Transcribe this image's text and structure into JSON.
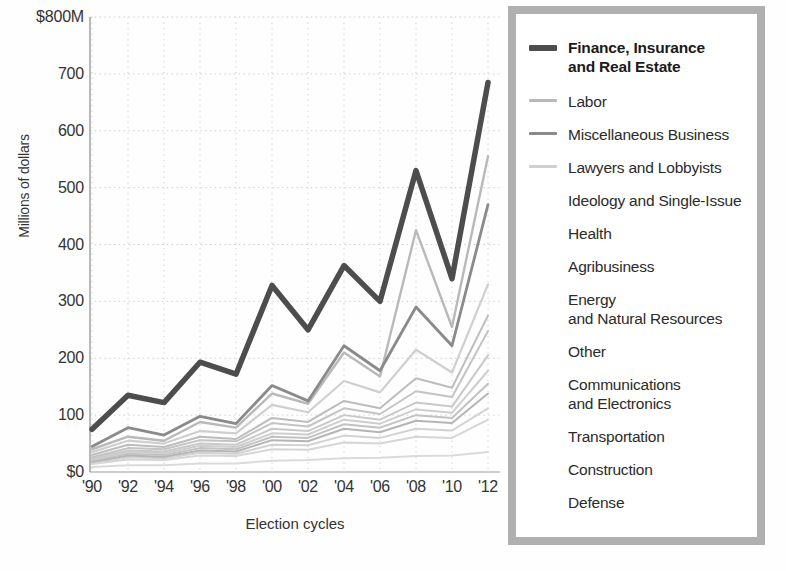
{
  "axes": {
    "y_label": "Millions of dollars",
    "y_ticks": [
      "$800M",
      "700",
      "600",
      "500",
      "400",
      "300",
      "200",
      "100",
      "$0"
    ],
    "x_label": "Election cycles",
    "x_ticks": [
      "'90",
      "'92",
      "'94",
      "'96",
      "'98",
      "'00",
      "'02",
      "'04",
      "'06",
      "'08",
      "'10",
      "'12"
    ]
  },
  "legend": {
    "items": [
      {
        "label": "Finance, Insurance\nand Real Estate",
        "color": "#4d4d4d",
        "width": 5.5,
        "swatch": true,
        "primary": true
      },
      {
        "label": "Labor",
        "color": "#b9b9b9",
        "width": 2.4,
        "swatch": true,
        "primary": false
      },
      {
        "label": "Miscellaneous Business",
        "color": "#8a8a8a",
        "width": 2.8,
        "swatch": true,
        "primary": false
      },
      {
        "label": "Lawyers and Lobbyists",
        "color": "#cfcfcf",
        "width": 2.2,
        "swatch": true,
        "primary": false
      },
      {
        "label": "Ideology and Single-Issue",
        "color": "#bdbdbd",
        "width": 2.0,
        "swatch": false,
        "primary": false
      },
      {
        "label": "Health",
        "color": "#c4c4c4",
        "width": 2.0,
        "swatch": false,
        "primary": false
      },
      {
        "label": "Agribusiness",
        "color": "#c9c9c9",
        "width": 2.0,
        "swatch": false,
        "primary": false
      },
      {
        "label": "Energy\nand Natural Resources",
        "color": "#cecece",
        "width": 2.0,
        "swatch": false,
        "primary": false
      },
      {
        "label": "Other",
        "color": "#c2c2c2",
        "width": 2.0,
        "swatch": false,
        "primary": false
      },
      {
        "label": "Communications\nand Electronics",
        "color": "#b5b5b5",
        "width": 2.0,
        "swatch": false,
        "primary": false
      },
      {
        "label": "Transportation",
        "color": "#d2d2d2",
        "width": 2.0,
        "swatch": false,
        "primary": false
      },
      {
        "label": "Construction",
        "color": "#d6d6d6",
        "width": 2.0,
        "swatch": false,
        "primary": false
      },
      {
        "label": "Defense",
        "color": "#dadada",
        "width": 2.0,
        "swatch": false,
        "primary": false
      }
    ]
  },
  "chart_data": {
    "type": "line",
    "title": "",
    "xlabel": "Election cycles",
    "ylabel": "Millions of dollars",
    "categories": [
      "'90",
      "'92",
      "'94",
      "'96",
      "'98",
      "'00",
      "'02",
      "'04",
      "'06",
      "'08",
      "'10",
      "'12"
    ],
    "ylim": [
      0,
      800
    ],
    "yticks": [
      0,
      100,
      200,
      300,
      400,
      500,
      600,
      700,
      800
    ],
    "grid": "dotted",
    "legend_position": "right",
    "units": "millions of US dollars",
    "series": [
      {
        "name": "Finance, Insurance and Real Estate",
        "color": "#4d4d4d",
        "width": 5.5,
        "values": [
          75,
          135,
          122,
          193,
          172,
          328,
          250,
          363,
          300,
          530,
          340,
          685
        ]
      },
      {
        "name": "Labor",
        "color": "#b9b9b9",
        "width": 2.4,
        "values": [
          40,
          62,
          55,
          88,
          78,
          138,
          120,
          210,
          168,
          425,
          255,
          555
        ]
      },
      {
        "name": "Miscellaneous Business",
        "color": "#8a8a8a",
        "width": 2.8,
        "values": [
          45,
          78,
          65,
          98,
          85,
          152,
          125,
          222,
          178,
          290,
          222,
          470
        ]
      },
      {
        "name": "Lawyers and Lobbyists",
        "color": "#cfcfcf",
        "width": 2.2,
        "values": [
          35,
          55,
          50,
          72,
          68,
          118,
          105,
          160,
          140,
          215,
          175,
          330
        ]
      },
      {
        "name": "Ideology and Single-Issue",
        "color": "#bdbdbd",
        "width": 2.0,
        "values": [
          30,
          48,
          44,
          62,
          58,
          95,
          88,
          125,
          112,
          165,
          148,
          275
        ]
      },
      {
        "name": "Health",
        "color": "#c4c4c4",
        "width": 2.0,
        "values": [
          26,
          42,
          40,
          56,
          54,
          86,
          80,
          112,
          102,
          142,
          132,
          248
        ]
      },
      {
        "name": "Agribusiness",
        "color": "#c9c9c9",
        "width": 2.0,
        "values": [
          24,
          38,
          36,
          50,
          48,
          76,
          72,
          100,
          92,
          122,
          115,
          205
        ]
      },
      {
        "name": "Energy and Natural Resources",
        "color": "#cecece",
        "width": 2.0,
        "values": [
          22,
          35,
          33,
          46,
          44,
          68,
          66,
          92,
          85,
          110,
          104,
          178
        ]
      },
      {
        "name": "Other",
        "color": "#c2c2c2",
        "width": 2.0,
        "values": [
          20,
          32,
          30,
          42,
          40,
          62,
          60,
          84,
          78,
          100,
          95,
          155
        ]
      },
      {
        "name": "Communications and Electronics",
        "color": "#b5b5b5",
        "width": 2.0,
        "values": [
          18,
          29,
          27,
          38,
          36,
          56,
          54,
          76,
          70,
          90,
          86,
          138
        ]
      },
      {
        "name": "Transportation",
        "color": "#d2d2d2",
        "width": 2.0,
        "values": [
          16,
          26,
          24,
          34,
          32,
          48,
          47,
          64,
          60,
          76,
          73,
          112
        ]
      },
      {
        "name": "Construction",
        "color": "#d6d6d6",
        "width": 2.0,
        "values": [
          14,
          22,
          21,
          29,
          28,
          40,
          39,
          52,
          50,
          62,
          60,
          92
        ]
      },
      {
        "name": "Defense",
        "color": "#dadada",
        "width": 2.0,
        "values": [
          9,
          12,
          12,
          15,
          15,
          20,
          21,
          24,
          25,
          28,
          29,
          35
        ]
      }
    ]
  }
}
